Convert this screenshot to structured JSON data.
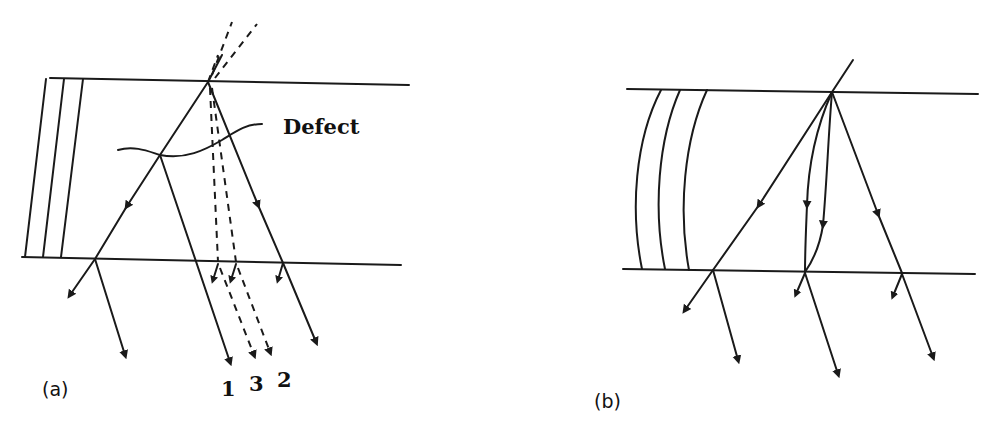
{
  "figure": {
    "panels": [
      {
        "id": "a",
        "label": "(a)",
        "annotation": "Defect",
        "ray_labels": [
          "1",
          "3",
          "2"
        ],
        "description": "Beam entering a layered crystal plate, split at a defect into transmitted and diffracted rays; dashed rays indicate beams without defect"
      },
      {
        "id": "b",
        "label": "(b)",
        "description": "Beam entering a bent (curved-lattice) crystal plate; diffracted ray paths curve inside the crystal"
      }
    ],
    "colors": {
      "ink": "#1a1a1a",
      "background": "#ffffff"
    }
  }
}
